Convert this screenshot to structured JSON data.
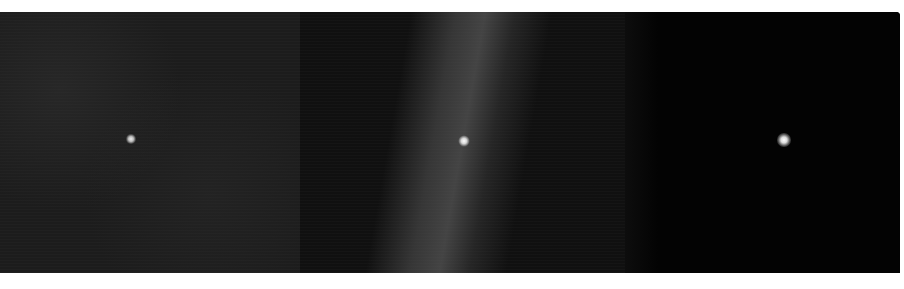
{
  "image": {
    "description": "Three-panel dark astronomical image strip, each panel centered on a single point source",
    "panels": [
      {
        "id": "panel-1",
        "background": "dark gray noisy field",
        "source": "faint point source near center-left"
      },
      {
        "id": "panel-2",
        "background": "diffuse nebulous vertical band",
        "source": "bright point source within nebulosity"
      },
      {
        "id": "panel-3",
        "background": "near-black field",
        "source": "bright isolated point source"
      }
    ],
    "colors": {
      "page_background": "#ffffff",
      "panel_1": "#1c1c1c",
      "panel_2": "#101010",
      "panel_3": "#030303",
      "star": "#f0f0f0"
    }
  }
}
